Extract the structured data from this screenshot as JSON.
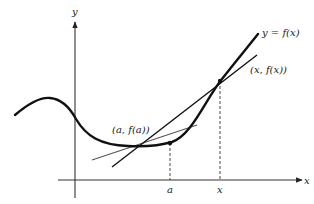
{
  "diagram": {
    "type": "calculus-derivative-secant-tangent",
    "axes": {
      "x_label": "x",
      "y_label": "y"
    },
    "curve": {
      "label": "y = f(x)"
    },
    "points": [
      {
        "label": "(a, f(a))",
        "tick_label": "a"
      },
      {
        "label": "(x, f(x))",
        "tick_label": "x"
      }
    ],
    "lines": {
      "tangent": "tangent-at-a",
      "secant": "secant-through-a-and-x"
    },
    "colors": {
      "curve": "#111111",
      "secant": "#111111",
      "tangent": "#555555",
      "axes": "#333333"
    }
  }
}
